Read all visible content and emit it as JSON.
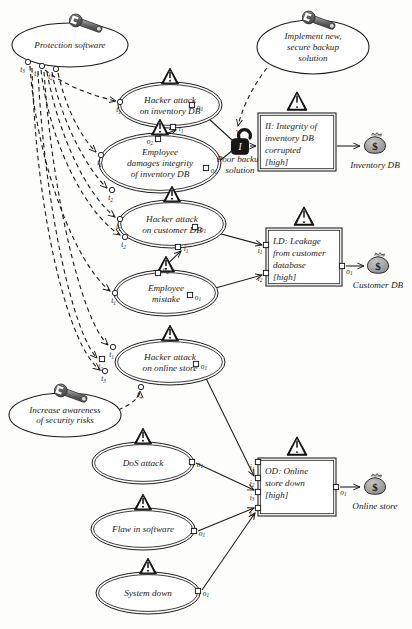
{
  "diagram": {
    "colors": {
      "line": "#1a1a1a",
      "fill_white": "#ffffff",
      "icon_dark": "#2b2b2b",
      "icon_gray": "#8c8c8c",
      "asset_gray": "#9a9a9a",
      "page_bg": "#fdfdfc"
    }
  },
  "treatments": [
    {
      "id": "protection-software",
      "label": "Protection software",
      "icon": "wrench-icon",
      "cx": 70,
      "cy": 45,
      "rx": 58,
      "ry": 22,
      "ports": [
        {
          "name": "t3",
          "x": 28,
          "y": 62
        },
        {
          "name": "t1",
          "x": 42,
          "y": 66
        },
        {
          "name": "t2",
          "x": 56,
          "y": 69
        }
      ]
    },
    {
      "id": "implement-new-secure-backup-solution",
      "label": "Implement new, secure backup solution",
      "lines": [
        "Implement new,",
        "secure backup",
        "solution"
      ],
      "icon": "wrench-icon",
      "cx": 313,
      "cy": 47,
      "rx": 56,
      "ry": 27,
      "ports": []
    },
    {
      "id": "increase-awareness-of-security-risks",
      "label": "Increase awareness of security risks",
      "lines": [
        "Increase awareness",
        "of security risks"
      ],
      "icon": "wrench-icon",
      "cx": 65,
      "cy": 415,
      "rx": 56,
      "ry": 22,
      "ports": []
    }
  ],
  "threat_scenarios": [
    {
      "id": "hacker-attack-on-inventory-db",
      "lines": [
        "Hacker attack",
        "on inventory DB"
      ],
      "icon": "warning-triangle-icon",
      "cx": 170,
      "cy": 105,
      "rx": 52,
      "ry": 23,
      "inputs": [
        {
          "name": "t1",
          "x": 120,
          "y": 102,
          "shape": "circle"
        }
      ],
      "outputs": [
        {
          "name": "o1",
          "x": 192,
          "y": 105,
          "shape": "square"
        },
        {
          "name": "i1",
          "x": 173,
          "y": 127,
          "shape": "square",
          "role": "input-bottom"
        }
      ]
    },
    {
      "id": "employee-damages-integrity-of-inventory-db",
      "lines": [
        "Employee",
        "damages integrity",
        "of inventory DB"
      ],
      "icon": "warning-triangle-icon",
      "cx": 160,
      "cy": 163,
      "rx": 61,
      "ry": 30,
      "inputs": [
        {
          "name": "t1",
          "x": 101,
          "y": 155,
          "shape": "circle"
        },
        {
          "name": "t2",
          "x": 112,
          "y": 190,
          "shape": "circle"
        }
      ],
      "outputs": [
        {
          "name": "o2",
          "x": 158,
          "y": 139,
          "shape": "square"
        },
        {
          "name": "o1",
          "x": 206,
          "y": 168,
          "shape": "square"
        }
      ]
    },
    {
      "id": "hacker-attack-on-customer-db",
      "lines": [
        "Hacker attack",
        "on customer DB"
      ],
      "icon": "warning-triangle-icon",
      "cx": 172,
      "cy": 224,
      "rx": 54,
      "ry": 24,
      "inputs": [
        {
          "name": "t1",
          "x": 120,
          "y": 219,
          "shape": "circle"
        },
        {
          "name": "t2",
          "x": 125,
          "y": 237,
          "shape": "circle"
        }
      ],
      "outputs": [
        {
          "name": "o1",
          "x": 195,
          "y": 227,
          "shape": "square"
        },
        {
          "name": "i1",
          "x": 178,
          "y": 247,
          "shape": "square",
          "role": "input-bottom"
        }
      ]
    },
    {
      "id": "employee-mistake",
      "lines": [
        "Employee",
        "mistake"
      ],
      "icon": "warning-triangle-icon",
      "cx": 166,
      "cy": 293,
      "rx": 52,
      "ry": 23,
      "inputs": [
        {
          "name": "t1",
          "x": 115,
          "y": 293,
          "shape": "circle"
        }
      ],
      "outputs": [
        {
          "name": "o2",
          "x": 158,
          "y": 273,
          "shape": "square"
        },
        {
          "name": "o1",
          "x": 190,
          "y": 295,
          "shape": "square"
        }
      ]
    },
    {
      "id": "hacker-attack-on-online-store",
      "lines": [
        "Hacker attack",
        "on online store"
      ],
      "icon": "warning-triangle-icon",
      "cx": 170,
      "cy": 362,
      "rx": 55,
      "ry": 23,
      "inputs": [
        {
          "name": "t1",
          "x": 113,
          "y": 347,
          "shape": "circle"
        },
        {
          "name": "t2",
          "x": 102,
          "y": 359,
          "shape": "square"
        },
        {
          "name": "t3",
          "x": 105,
          "y": 371,
          "shape": "circle"
        },
        {
          "name": "t4",
          "x": 141,
          "y": 387,
          "shape": "circle"
        }
      ],
      "outputs": [
        {
          "name": "o1",
          "x": 196,
          "y": 364,
          "shape": "square"
        }
      ]
    },
    {
      "id": "dos-attack",
      "lines": [
        "DoS attack"
      ],
      "icon": "warning-triangle-icon",
      "cx": 143,
      "cy": 463,
      "rx": 51,
      "ry": 21,
      "inputs": [],
      "outputs": [
        {
          "name": "o1",
          "x": 192,
          "y": 462,
          "shape": "square"
        }
      ]
    },
    {
      "id": "flaw-in-software",
      "lines": [
        "Flaw in software"
      ],
      "icon": "warning-triangle-icon",
      "cx": 143,
      "cy": 529,
      "rx": 52,
      "ry": 21,
      "inputs": [],
      "outputs": [
        {
          "name": "o1",
          "x": 194,
          "y": 531,
          "shape": "square"
        }
      ]
    },
    {
      "id": "system-down",
      "lines": [
        "System down"
      ],
      "icon": "warning-triangle-icon",
      "cx": 148,
      "cy": 593,
      "rx": 52,
      "ry": 21,
      "inputs": [],
      "outputs": [
        {
          "name": "o1",
          "x": 198,
          "y": 591,
          "shape": "square"
        }
      ]
    }
  ],
  "vulnerabilities": [
    {
      "id": "poor-backup-solution",
      "label": "Poor backup solution",
      "lines": [
        "Poor backup",
        "solution"
      ],
      "icon": "open-padlock-icon",
      "x": 236,
      "y": 130,
      "marker": "W"
    }
  ],
  "incidents": [
    {
      "id": "integrity-of-inventory-db-corrupted",
      "lines": [
        "II: Integrity of",
        "inventory DB",
        "corrupted",
        "[high]"
      ],
      "icon": "warning-triangle-icon",
      "x": 258,
      "y": 113,
      "w": 78,
      "h": 58,
      "inputs": [
        {
          "name": "",
          "x": 258,
          "y": 146,
          "shape": "arrow"
        }
      ],
      "outputs": [
        {
          "name": "",
          "x": 336,
          "y": 146,
          "shape": "arrow"
        }
      ]
    },
    {
      "id": "leakage-from-customer-database",
      "lines": [
        "LD: Leakage",
        "from customer",
        "database",
        "[high]"
      ],
      "icon": "warning-triangle-icon",
      "x": 266,
      "y": 228,
      "w": 76,
      "h": 58,
      "inputs": [
        {
          "name": "i1",
          "x": 266,
          "y": 245,
          "shape": "square"
        },
        {
          "name": "i2",
          "x": 266,
          "y": 273,
          "shape": "square"
        }
      ],
      "outputs": [
        {
          "name": "o1",
          "x": 342,
          "y": 266,
          "shape": "square"
        }
      ]
    },
    {
      "id": "online-store-down",
      "lines": [
        "OD: Online",
        "store down",
        "[high]"
      ],
      "icon": "warning-triangle-icon",
      "x": 258,
      "y": 458,
      "w": 78,
      "h": 58,
      "inputs": [
        {
          "name": "i1",
          "x": 258,
          "y": 462,
          "shape": "square"
        },
        {
          "name": "i2",
          "x": 258,
          "y": 478,
          "shape": "square"
        },
        {
          "name": "i3",
          "x": 258,
          "y": 492,
          "shape": "square"
        },
        {
          "name": "i4",
          "x": 258,
          "y": 508,
          "shape": "square"
        }
      ],
      "outputs": [
        {
          "name": "o1",
          "x": 336,
          "y": 487,
          "shape": "square"
        }
      ]
    }
  ],
  "assets": [
    {
      "id": "inventory-db",
      "label": "Inventory DB",
      "icon": "money-bag-icon",
      "cx": 375,
      "cy": 146
    },
    {
      "id": "customer-db",
      "label": "Customer DB",
      "icon": "money-bag-icon",
      "cx": 378,
      "cy": 266
    },
    {
      "id": "online-store",
      "label": "Online store",
      "icon": "money-bag-icon",
      "cx": 375,
      "cy": 487
    }
  ],
  "labels": {
    "asset_symbol": "$",
    "warning_symbol": "!",
    "lock_symbol": "I"
  }
}
